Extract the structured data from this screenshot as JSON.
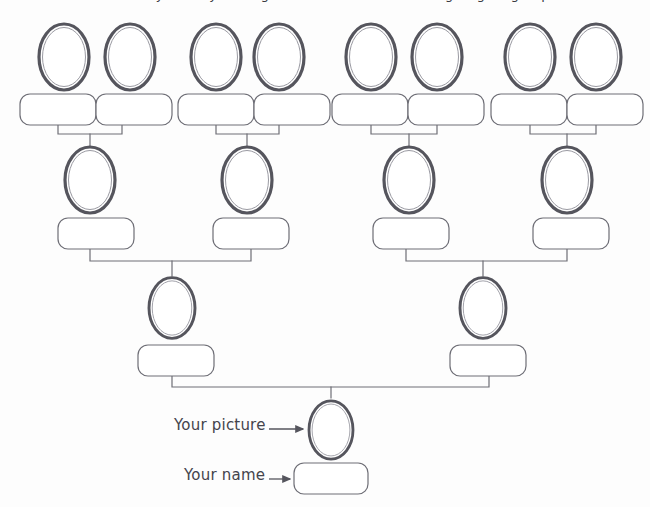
{
  "page": {
    "background_color": "#fdfdfd",
    "width": 650,
    "height": 507,
    "clipped_heading": "Fill in the family tree by writing in the names and drawing or gluing in pictures"
  },
  "style": {
    "frame_outer_color": "#55555d",
    "frame_inner_color": "#8a8a92",
    "box_stroke_color": "#6e6e76",
    "connector_color": "#6e6e76",
    "label_color": "#44444c",
    "fill_color": "#ffffff"
  },
  "annotations": [
    {
      "id": "your-picture",
      "label": "Your picture",
      "arrow": "arrow-right-icon",
      "target": "self-photo-frame"
    },
    {
      "id": "your-name",
      "label": "Your name",
      "arrow": "arrow-right-icon",
      "target": "self-name-box"
    }
  ],
  "generations": [
    {
      "id": "great-grandparents",
      "level": 1,
      "label": "Great-grandparents",
      "photo_frames": [
        {
          "id": "ggp-1",
          "cx": 64,
          "cy": 57,
          "value": ""
        },
        {
          "id": "ggp-2",
          "cx": 130,
          "cy": 57,
          "value": ""
        },
        {
          "id": "ggp-3",
          "cx": 216,
          "cy": 57,
          "value": ""
        },
        {
          "id": "ggp-4",
          "cx": 279,
          "cy": 57,
          "value": ""
        },
        {
          "id": "ggp-5",
          "cx": 371,
          "cy": 57,
          "value": ""
        },
        {
          "id": "ggp-6",
          "cx": 437,
          "cy": 57,
          "value": ""
        },
        {
          "id": "ggp-7",
          "cx": 530,
          "cy": 57,
          "value": ""
        },
        {
          "id": "ggp-8",
          "cx": 596,
          "cy": 57,
          "value": ""
        }
      ],
      "name_boxes": [
        {
          "id": "ggp-name-1",
          "x": 20,
          "y": 94,
          "w": 76,
          "h": 31,
          "value": ""
        },
        {
          "id": "ggp-name-2",
          "x": 96,
          "y": 94,
          "w": 76,
          "h": 31,
          "value": ""
        },
        {
          "id": "ggp-name-3",
          "x": 178,
          "y": 94,
          "w": 76,
          "h": 31,
          "value": ""
        },
        {
          "id": "ggp-name-4",
          "x": 254,
          "y": 94,
          "w": 76,
          "h": 31,
          "value": ""
        },
        {
          "id": "ggp-name-5",
          "x": 332,
          "y": 94,
          "w": 76,
          "h": 31,
          "value": ""
        },
        {
          "id": "ggp-name-6",
          "x": 408,
          "y": 94,
          "w": 76,
          "h": 31,
          "value": ""
        },
        {
          "id": "ggp-name-7",
          "x": 491,
          "y": 94,
          "w": 76,
          "h": 31,
          "value": ""
        },
        {
          "id": "ggp-name-8",
          "x": 567,
          "y": 94,
          "w": 76,
          "h": 31,
          "value": ""
        }
      ]
    },
    {
      "id": "grandparents",
      "level": 2,
      "label": "Grandparents",
      "photo_frames": [
        {
          "id": "gp-1",
          "cx": 90,
          "cy": 180,
          "value": ""
        },
        {
          "id": "gp-2",
          "cx": 247,
          "cy": 180,
          "value": ""
        },
        {
          "id": "gp-3",
          "cx": 409,
          "cy": 180,
          "value": ""
        },
        {
          "id": "gp-4",
          "cx": 567,
          "cy": 180,
          "value": ""
        }
      ],
      "name_boxes": [
        {
          "id": "gp-name-1",
          "x": 58,
          "y": 218,
          "w": 76,
          "h": 31,
          "value": ""
        },
        {
          "id": "gp-name-2",
          "x": 213,
          "y": 218,
          "w": 76,
          "h": 31,
          "value": ""
        },
        {
          "id": "gp-name-3",
          "x": 373,
          "y": 218,
          "w": 76,
          "h": 31,
          "value": ""
        },
        {
          "id": "gp-name-4",
          "x": 533,
          "y": 218,
          "w": 76,
          "h": 31,
          "value": ""
        }
      ]
    },
    {
      "id": "parents",
      "level": 3,
      "label": "Parents",
      "photo_frames": [
        {
          "id": "par-1",
          "cx": 172,
          "cy": 308,
          "value": ""
        },
        {
          "id": "par-2",
          "cx": 483,
          "cy": 308,
          "value": ""
        }
      ],
      "name_boxes": [
        {
          "id": "par-name-1",
          "x": 138,
          "y": 345,
          "w": 76,
          "h": 31,
          "value": ""
        },
        {
          "id": "par-name-2",
          "x": 450,
          "y": 345,
          "w": 76,
          "h": 31,
          "value": ""
        }
      ]
    },
    {
      "id": "self",
      "level": 4,
      "label": "You",
      "photo_frames": [
        {
          "id": "self-photo-frame",
          "cx": 331,
          "cy": 430,
          "value": ""
        }
      ],
      "name_boxes": [
        {
          "id": "self-name-box",
          "x": 294,
          "y": 463,
          "w": 74,
          "h": 31,
          "value": ""
        }
      ]
    }
  ]
}
